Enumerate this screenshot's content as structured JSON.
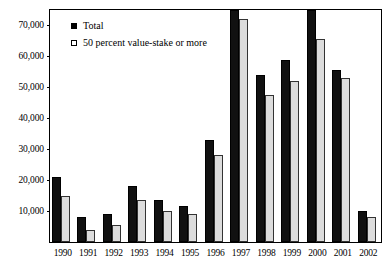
{
  "chart_data": {
    "type": "bar",
    "title": "",
    "subtitle": "",
    "xlabel": "",
    "ylabel": "",
    "categories": [
      "1990",
      "1991",
      "1992",
      "1993",
      "1994",
      "1995",
      "1996",
      "1997",
      "1998",
      "1999",
      "2000",
      "2001",
      "2002"
    ],
    "series": [
      {
        "name": "Total",
        "marker": "filled-square",
        "color": "#111111",
        "values": [
          21000,
          8000,
          9000,
          18000,
          13500,
          11500,
          33000,
          75000,
          54000,
          59000,
          75000,
          55500,
          10000
        ]
      },
      {
        "name": "50 percent value-stake or more",
        "marker": "open-square",
        "color": "#dcdcdc",
        "values": [
          15000,
          4000,
          5500,
          13500,
          10000,
          9000,
          28000,
          72000,
          47500,
          52000,
          65500,
          53000,
          8000
        ]
      }
    ],
    "ylim": [
      0,
      75000
    ],
    "yticks": [
      10000,
      20000,
      30000,
      40000,
      50000,
      60000,
      70000
    ],
    "ytick_labels": [
      "10,000",
      "20,000",
      "30,000",
      "40,000",
      "50,000",
      "60,000",
      "70,000"
    ],
    "grid": false,
    "legend_position": "top-left"
  },
  "legend": {
    "items": [
      {
        "label": "Total"
      },
      {
        "label": "50 percent value-stake or more"
      }
    ]
  }
}
